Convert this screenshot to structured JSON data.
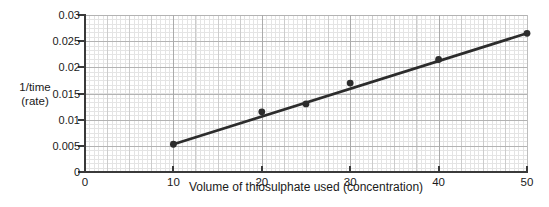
{
  "chart_data": {
    "type": "scatter",
    "title": "",
    "xlabel": "Volume of thiosulphate used (concentration)",
    "ylabel": "1/time\n(rate)",
    "xlim": [
      0,
      50
    ],
    "ylim": [
      0,
      0.03
    ],
    "x_ticks": [
      0,
      10,
      20,
      30,
      40,
      50
    ],
    "x_tick_labels": [
      "0",
      "10",
      "20",
      "30",
      "40",
      "50"
    ],
    "y_ticks": [
      0,
      0.005,
      0.01,
      0.015,
      0.02,
      0.025,
      0.03
    ],
    "y_tick_labels": [
      "0",
      "0.005",
      "0.01",
      "0.015",
      "0.02",
      "0.025",
      "0.03"
    ],
    "grid": "fine graph-paper grid, minor + medium + major lines, on",
    "legend": "none",
    "points": [
      {
        "x": 10,
        "y": 0.0053
      },
      {
        "x": 20,
        "y": 0.0115
      },
      {
        "x": 25,
        "y": 0.013
      },
      {
        "x": 30,
        "y": 0.017
      },
      {
        "x": 40,
        "y": 0.0215
      },
      {
        "x": 50,
        "y": 0.0265
      }
    ],
    "trendline": {
      "x1": 10,
      "y1": 0.0053,
      "x2": 50,
      "y2": 0.0265
    },
    "colors": {
      "point": "#2c2c2c",
      "line": "#2c2c2c",
      "axis": "#3a3a3a",
      "text": "#1a1a1a",
      "grid_minor": "#e4e4e4",
      "grid_medium": "#cccccc",
      "grid_major": "#ababab",
      "background": "#ffffff"
    }
  }
}
